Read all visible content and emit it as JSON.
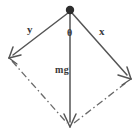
{
  "figure": {
    "kind": "force-parallelogram-diagram",
    "width": 137,
    "height": 135,
    "background_color": "#ffffff",
    "stroke_color": "#555555",
    "label_color": "#3a3a3a",
    "labels": {
      "left_vector": "y",
      "right_vector": "x",
      "angle": "θ",
      "weight": "mg"
    },
    "geometry": {
      "apex": {
        "x": 70,
        "y": 11
      },
      "pivot_dot_radius": 4.2,
      "left_arrow_tip": {
        "x": 10,
        "y": 57
      },
      "right_arrow_tip": {
        "x": 130,
        "y": 78
      },
      "bottom_arrow_tip": {
        "x": 70,
        "y": 126
      },
      "dashed_left_from": {
        "x": 12,
        "y": 61
      },
      "dashed_left_to": {
        "x": 67,
        "y": 123
      },
      "dashed_right_from": {
        "x": 74,
        "y": 123
      },
      "dashed_right_to": {
        "x": 127,
        "y": 82
      }
    },
    "vectors": [
      {
        "name": "y",
        "label": "y",
        "style": "solid",
        "arrow": true,
        "direction": "down-left"
      },
      {
        "name": "x",
        "label": "x",
        "style": "solid",
        "arrow": true,
        "direction": "down-right"
      },
      {
        "name": "mg",
        "label": "mg",
        "style": "solid",
        "arrow": true,
        "direction": "down"
      }
    ],
    "construction_lines": [
      {
        "name": "parallel-to-x",
        "style": "dash-dot"
      },
      {
        "name": "parallel-to-y",
        "style": "dash-dot"
      }
    ]
  }
}
